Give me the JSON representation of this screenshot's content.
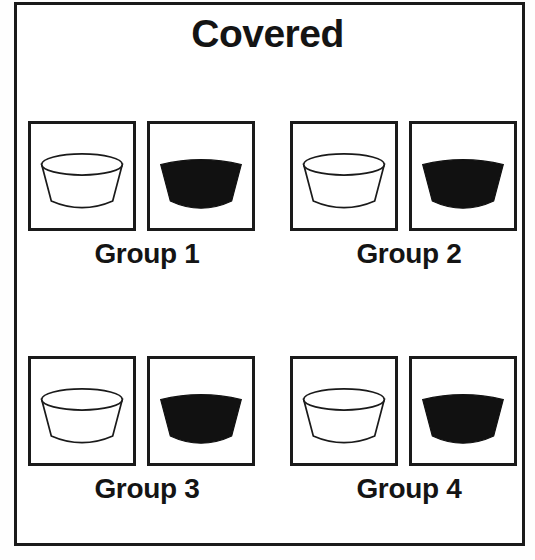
{
  "figure": {
    "title": "Covered",
    "background_color": "#ffffff",
    "frame_color": "#1a1a1a",
    "empty_bowl_fill": "#ffffff",
    "filled_bowl_fill": "#111111",
    "outline_color": "#1a1a1a"
  },
  "groups": [
    {
      "label": "Group 1",
      "position": "top-left",
      "panels": [
        {
          "icon": "empty-bowl-icon",
          "state": "empty",
          "fill": "#ffffff"
        },
        {
          "icon": "filled-bowl-icon",
          "state": "filled",
          "fill": "#111111"
        }
      ]
    },
    {
      "label": "Group 2",
      "position": "top-right",
      "panels": [
        {
          "icon": "empty-bowl-icon",
          "state": "empty",
          "fill": "#ffffff"
        },
        {
          "icon": "filled-bowl-icon",
          "state": "filled",
          "fill": "#111111"
        }
      ]
    },
    {
      "label": "Group 3",
      "position": "bottom-left",
      "panels": [
        {
          "icon": "empty-bowl-icon",
          "state": "empty",
          "fill": "#ffffff"
        },
        {
          "icon": "filled-bowl-icon",
          "state": "filled",
          "fill": "#111111"
        }
      ]
    },
    {
      "label": "Group 4",
      "position": "bottom-right",
      "panels": [
        {
          "icon": "empty-bowl-icon",
          "state": "empty",
          "fill": "#ffffff"
        },
        {
          "icon": "filled-bowl-icon",
          "state": "filled",
          "fill": "#111111"
        }
      ]
    }
  ]
}
